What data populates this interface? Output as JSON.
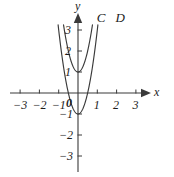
{
  "figure": {
    "background_color": "#ffffff",
    "ink_color": "#3a3a3a",
    "text_color": "#1c1c1c",
    "width": 174,
    "height": 177
  },
  "axes": {
    "x_name": "x",
    "y_name": "y",
    "origin_label": "0",
    "x_ticks": [
      {
        "value": -3,
        "label": "−3"
      },
      {
        "value": -2,
        "label": "−2"
      },
      {
        "value": -1,
        "label": "−1"
      },
      {
        "value": 1,
        "label": "1"
      },
      {
        "value": 2,
        "label": "2"
      },
      {
        "value": 3,
        "label": "3"
      }
    ],
    "y_ticks": [
      {
        "value": 3,
        "label": "3"
      },
      {
        "value": 2,
        "label": "2"
      },
      {
        "value": 1,
        "label": "1"
      },
      {
        "value": -1,
        "label": "−1"
      },
      {
        "value": -2,
        "label": "−2"
      },
      {
        "value": -3,
        "label": "−3"
      }
    ]
  },
  "chart_data": {
    "type": "line",
    "title": "",
    "xlabel": "x",
    "ylabel": "y",
    "xlim": [
      -3.6,
      3.6
    ],
    "ylim": [
      -3.6,
      3.6
    ],
    "grid": false,
    "legend": "inline-labels",
    "series": [
      {
        "name": "C",
        "label": "C",
        "label_position": {
          "x": 1.18,
          "y": 3.6
        },
        "vertex": [
          0,
          1
        ],
        "equation": "y = 4x^2 + 1",
        "coefficient_a": 4,
        "x_intercepts": [],
        "y_intercept": 1,
        "x_domain": [
          -0.75,
          0.75
        ],
        "points": [
          [
            -0.75,
            3.25
          ],
          [
            -0.6,
            2.44
          ],
          [
            -0.45,
            1.81
          ],
          [
            -0.3,
            1.36
          ],
          [
            -0.15,
            1.09
          ],
          [
            0,
            1
          ],
          [
            0.15,
            1.09
          ],
          [
            0.3,
            1.36
          ],
          [
            0.45,
            1.81
          ],
          [
            0.6,
            2.44
          ],
          [
            0.75,
            3.25
          ]
        ]
      },
      {
        "name": "D",
        "label": "D",
        "label_position": {
          "x": 2.15,
          "y": 3.6
        },
        "vertex": [
          0,
          -1
        ],
        "equation": "y = 4x^2 - 1",
        "coefficient_a": 4,
        "x_intercepts": [
          -0.5,
          0.5
        ],
        "y_intercept": -1,
        "x_domain": [
          -1.03,
          1.03
        ],
        "points": [
          [
            -1.03,
            3.24
          ],
          [
            -0.85,
            1.89
          ],
          [
            -0.7,
            0.96
          ],
          [
            -0.5,
            0
          ],
          [
            -0.3,
            -0.64
          ],
          [
            -0.15,
            -0.91
          ],
          [
            0,
            -1
          ],
          [
            0.15,
            -0.91
          ],
          [
            0.3,
            -0.64
          ],
          [
            0.5,
            0
          ],
          [
            0.7,
            0.96
          ],
          [
            0.85,
            1.89
          ],
          [
            1.03,
            3.24
          ]
        ]
      }
    ]
  }
}
